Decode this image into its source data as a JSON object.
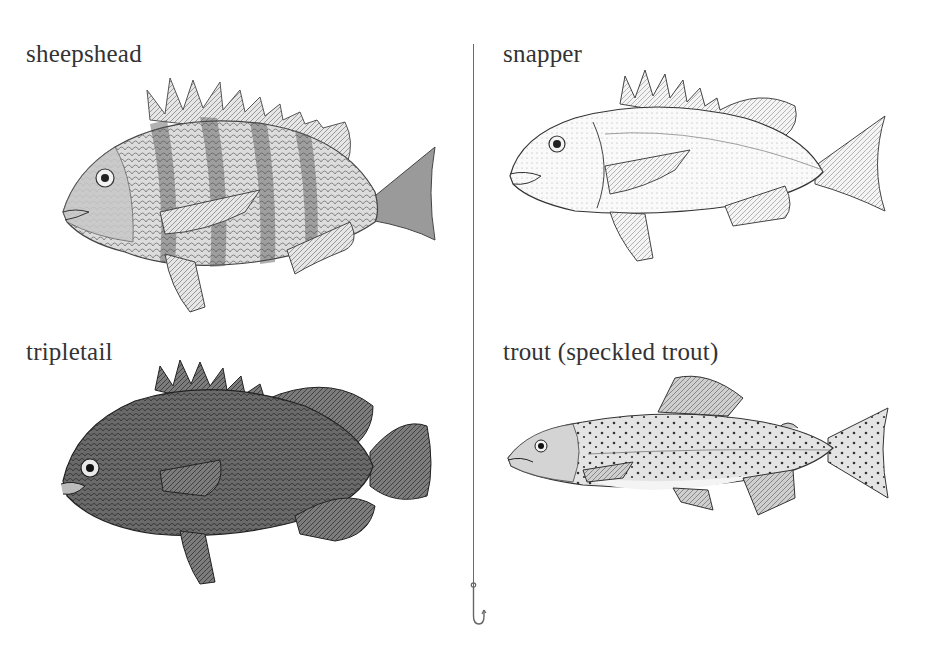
{
  "panels": [
    {
      "id": "sheepshead",
      "label": "sheepshead"
    },
    {
      "id": "snapper",
      "label": "snapper"
    },
    {
      "id": "tripletail",
      "label": "tripletail"
    },
    {
      "id": "trout",
      "label": "trout (speckled trout)"
    }
  ],
  "icons": {
    "divider": "fishing-line",
    "hook": "fishing-hook-icon"
  }
}
